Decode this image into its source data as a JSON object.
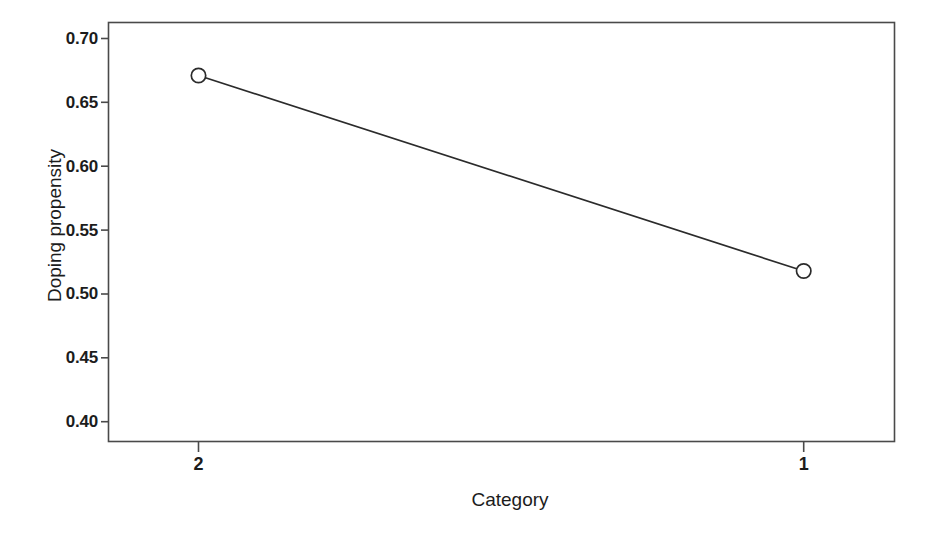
{
  "chart_data": {
    "type": "line",
    "title": "",
    "subtitle": "",
    "xlabel": "Category",
    "ylabel": "Doping propensity",
    "categories": [
      "2",
      "1"
    ],
    "x_tick_labels": [
      "2",
      "1"
    ],
    "y_tick_labels": [
      "0.70",
      "0.65",
      "0.60",
      "0.55",
      "0.50",
      "0.45",
      "0.40"
    ],
    "y_tick_values": [
      0.7,
      0.65,
      0.6,
      0.55,
      0.5,
      0.45,
      0.4
    ],
    "ylim": [
      0.3845,
      0.7125
    ],
    "xlim": [
      0,
      1
    ],
    "grid": false,
    "legend": null,
    "legend_position": "none",
    "annotations": [],
    "series": [
      {
        "name": "Doping propensity",
        "values": [
          0.671,
          0.518
        ],
        "marker": "open-circle",
        "line_color": "#2b2b2b",
        "marker_color": "#2b2b2b"
      }
    ]
  },
  "style": {
    "background": "#ffffff",
    "axis_color": "#4a4a4a",
    "text_color": "#1c1c1c",
    "line_color": "#2b2b2b"
  }
}
